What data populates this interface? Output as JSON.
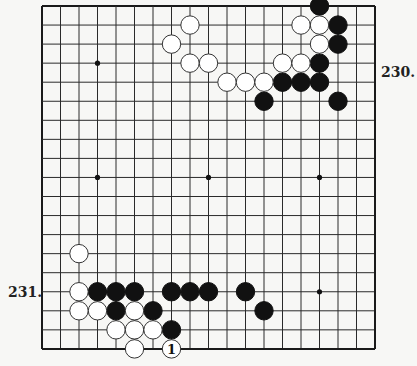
{
  "board": {
    "size": 19,
    "origin_x": 42,
    "origin_y": 6,
    "step_x": 18.5,
    "step_y": 19.05,
    "line_color": "#2a2a2a",
    "border_color": "#1a1a1a",
    "background": "#f7f7f5",
    "black_color": "#111111",
    "white_color": "#ffffff",
    "stone_radius": 9.2,
    "star_points": [
      [
        3,
        3
      ],
      [
        9,
        3
      ],
      [
        15,
        3
      ],
      [
        3,
        9
      ],
      [
        9,
        9
      ],
      [
        15,
        9
      ],
      [
        3,
        15
      ],
      [
        9,
        15
      ],
      [
        15,
        15
      ]
    ]
  },
  "stones": {
    "black": [
      [
        15,
        0
      ],
      [
        16,
        1
      ],
      [
        16,
        2
      ],
      [
        15,
        3
      ],
      [
        13,
        4
      ],
      [
        14,
        4
      ],
      [
        15,
        4
      ],
      [
        12,
        5
      ],
      [
        16,
        5
      ],
      [
        3,
        15
      ],
      [
        4,
        15
      ],
      [
        5,
        15
      ],
      [
        7,
        15
      ],
      [
        8,
        15
      ],
      [
        9,
        15
      ],
      [
        11,
        15
      ],
      [
        4,
        16
      ],
      [
        6,
        16
      ],
      [
        12,
        16
      ],
      [
        7,
        17
      ]
    ],
    "white": [
      [
        8,
        1
      ],
      [
        14,
        1
      ],
      [
        15,
        1
      ],
      [
        7,
        2
      ],
      [
        15,
        2
      ],
      [
        8,
        3
      ],
      [
        9,
        3
      ],
      [
        13,
        3
      ],
      [
        14,
        3
      ],
      [
        10,
        4
      ],
      [
        11,
        4
      ],
      [
        12,
        4
      ],
      [
        2,
        13
      ],
      [
        2,
        15
      ],
      [
        2,
        16
      ],
      [
        3,
        16
      ],
      [
        5,
        16
      ],
      [
        4,
        17
      ],
      [
        5,
        17
      ],
      [
        6,
        17
      ],
      [
        5,
        18
      ]
    ],
    "numbered": [
      {
        "col": 7,
        "row": 18,
        "color": "white",
        "text": "1"
      }
    ]
  },
  "labels": {
    "problem_top": "230.",
    "problem_bottom": "231."
  }
}
